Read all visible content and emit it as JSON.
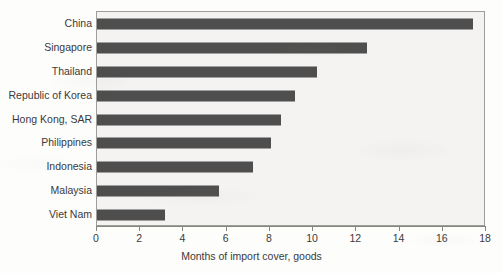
{
  "chart_data": {
    "type": "bar",
    "orientation": "horizontal",
    "title": "",
    "subtitle": "",
    "xlabel": "Months of import cover, goods",
    "ylabel": "",
    "categories": [
      "China",
      "Singapore",
      "Thailand",
      "Republic of Korea",
      "Hong Kong, SAR",
      "Philippines",
      "Indonesia",
      "Malaysia",
      "Viet Nam"
    ],
    "values": [
      17.4,
      12.5,
      10.2,
      9.15,
      8.5,
      8.05,
      7.2,
      5.65,
      3.15
    ],
    "xlim": [
      0,
      18
    ],
    "xticks": [
      0,
      2,
      4,
      6,
      8,
      10,
      12,
      14,
      16,
      18
    ],
    "xtick_labels": [
      "0",
      "2",
      "4",
      "6",
      "8",
      "10",
      "12",
      "14",
      "16",
      "18"
    ],
    "grid": false,
    "legend": null,
    "bar_color": "#4e4e4e",
    "plot_background": "#f4f3f1",
    "axis_color": "#86867f",
    "text_color": "#3a3a3a"
  }
}
